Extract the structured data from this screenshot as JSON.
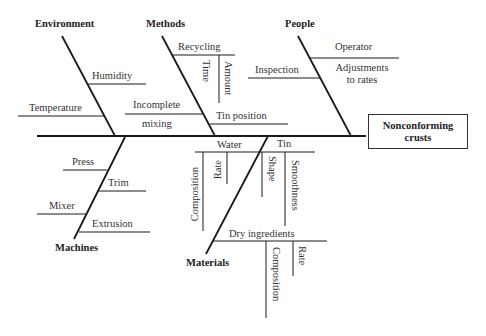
{
  "effect": {
    "line1": "Nonconforming",
    "line2": "crusts"
  },
  "categories": {
    "environment": {
      "label": "Environment",
      "causes": [
        "Humidity",
        "Temperature"
      ]
    },
    "methods": {
      "label": "Methods",
      "causes": {
        "recycling": {
          "label": "Recycling",
          "sub": [
            "Time",
            "Amount"
          ]
        },
        "incomplete_mixing": {
          "line1": "Incomplete",
          "line2": "mixing"
        },
        "tin_position": "Tin position"
      }
    },
    "people": {
      "label": "People",
      "causes": {
        "operator": {
          "label": "Operator",
          "sub_line1": "Adjustments",
          "sub_line2": "to rates"
        },
        "inspection": "Inspection"
      }
    },
    "machines": {
      "label": "Machines",
      "causes": [
        "Press",
        "Trim",
        "Mixer",
        "Extrusion"
      ]
    },
    "materials": {
      "label": "Materials",
      "causes": {
        "water": {
          "label": "Water",
          "sub": [
            "Composition",
            "Rate"
          ]
        },
        "tin": {
          "label": "Tin",
          "sub": [
            "Shape",
            "Smoothness"
          ]
        },
        "dry_ingredients": {
          "label": "Dry ingredients",
          "sub": [
            "Composition",
            "Rate"
          ]
        }
      }
    }
  }
}
